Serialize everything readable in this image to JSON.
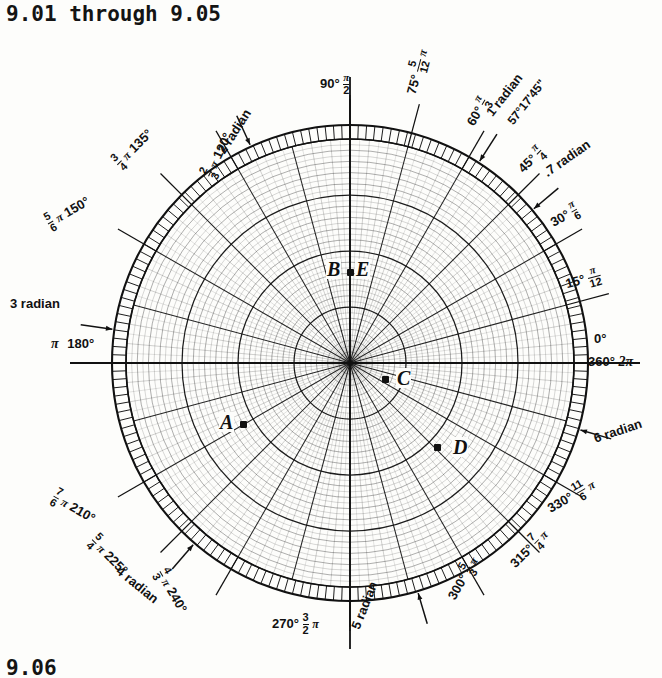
{
  "title": "9.01 through 9.05",
  "footer": "9.06",
  "chart_data": {
    "type": "polar-grid",
    "center_px": [
      350,
      363
    ],
    "radius_px": 238,
    "grid": {
      "radial_rings": 20,
      "angular_spokes_deg": 15,
      "fine_angular_ticks_deg": 2,
      "outer_tick_band": true
    },
    "axis_labels": [
      {
        "angle_deg": 0,
        "degree": "0°",
        "alt": "360°",
        "radian_n": "",
        "radian_d": "",
        "pi": "2π"
      },
      {
        "angle_deg": 15,
        "degree": "15°",
        "radian_n": "π",
        "radian_d": "12"
      },
      {
        "angle_deg": 30,
        "degree": "30°",
        "radian_n": "π",
        "radian_d": "6"
      },
      {
        "angle_deg": 45,
        "degree": "45°",
        "radian_n": "π",
        "radian_d": "4"
      },
      {
        "angle_deg": 60,
        "degree": "60°",
        "radian_n": "π",
        "radian_d": "3"
      },
      {
        "angle_deg": 75,
        "degree": "75°",
        "radian_n": "5",
        "radian_d": "12",
        "pi": "π"
      },
      {
        "angle_deg": 90,
        "degree": "90°",
        "radian_n": "π",
        "radian_d": "2"
      },
      {
        "angle_deg": 120,
        "degree": "120°",
        "radian_n": "2",
        "radian_d": "3",
        "pi": "π"
      },
      {
        "angle_deg": 135,
        "degree": "135°",
        "radian_n": "3",
        "radian_d": "4",
        "pi": "π"
      },
      {
        "angle_deg": 150,
        "degree": "150°",
        "radian_n": "5",
        "radian_d": "6",
        "pi": "π"
      },
      {
        "angle_deg": 180,
        "degree": "180°",
        "pi": "π"
      },
      {
        "angle_deg": 210,
        "degree": "210°",
        "radian_n": "7",
        "radian_d": "6",
        "pi": "π"
      },
      {
        "angle_deg": 225,
        "degree": "225°",
        "radian_n": "5",
        "radian_d": "4",
        "pi": "π"
      },
      {
        "angle_deg": 240,
        "degree": "240°",
        "radian_n": "4",
        "radian_d": "3",
        "pi": "π"
      },
      {
        "angle_deg": 270,
        "degree": "270°",
        "radian_n": "3",
        "radian_d": "2",
        "pi": "π"
      },
      {
        "angle_deg": 300,
        "degree": "300°",
        "radian_n": "5",
        "radian_d": "3",
        "pi": "π"
      },
      {
        "angle_deg": 315,
        "degree": "315°",
        "radian_n": "7",
        "radian_d": "4",
        "pi": "π"
      },
      {
        "angle_deg": 330,
        "degree": "330°",
        "radian_n": "11",
        "radian_d": "6",
        "pi": "π"
      }
    ],
    "radian_markers": [
      {
        "text": ".7 radian",
        "angle_deg": 40
      },
      {
        "text": "1 radian",
        "angle_deg": 57.296
      },
      {
        "text": "2 radian",
        "angle_deg": 114.6
      },
      {
        "text": "3 radian",
        "angle_deg": 171.9
      },
      {
        "text": "4 radian",
        "angle_deg": 229.2
      },
      {
        "text": "5 radian",
        "angle_deg": 286.5
      },
      {
        "text": "6 radian",
        "angle_deg": 343.8
      }
    ],
    "annotations": [
      "57°17'45\""
    ],
    "points": [
      {
        "label": "A",
        "x_px": 243,
        "y_px": 424,
        "label_x": 219,
        "label_y": 412
      },
      {
        "label": "B",
        "x_px": 350,
        "y_px": 272,
        "label_x": 326,
        "label_y": 259
      },
      {
        "label": "C",
        "x_px": 385,
        "y_px": 379,
        "label_x": 396,
        "label_y": 368
      },
      {
        "label": "D",
        "x_px": 437,
        "y_px": 447,
        "label_x": 452,
        "label_y": 437
      },
      {
        "label": "E",
        "x_px": 350,
        "y_px": 272,
        "label_x": 355,
        "label_y": 259
      }
    ]
  },
  "labels": {
    "deg_0": "0°",
    "deg_360": "360°",
    "two_pi": "2π",
    "deg_15": "15°",
    "deg_30": "30°",
    "deg_45": "45°",
    "deg_60": "60°",
    "deg_75": "75°",
    "deg_90": "90°",
    "deg_120": "120°",
    "deg_135": "135°",
    "deg_150": "150°",
    "deg_180": "180°",
    "deg_210": "210°",
    "deg_225": "225°",
    "deg_240": "240°",
    "deg_270": "270°",
    "deg_300": "300°",
    "deg_315": "315°",
    "deg_330": "330°",
    "pi": "π",
    "rad_07": ".7 radian",
    "rad_1": "1 radian",
    "rad_2": "2 radian",
    "rad_3": "3 radian",
    "rad_4": "4 radian",
    "rad_5": "5 radian",
    "rad_6": "6 radian",
    "dms": "57°17'45\"",
    "pt_a": "A",
    "pt_b": "B",
    "pt_c": "C",
    "pt_d": "D",
    "pt_e": "E"
  },
  "colors": {
    "ink": "#111111",
    "paper": "#fdfdfb"
  }
}
